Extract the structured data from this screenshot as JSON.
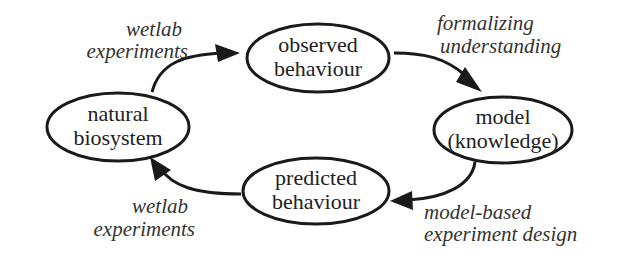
{
  "diagram": {
    "nodes": [
      {
        "id": "natural",
        "lines": [
          "natural",
          "biosystem"
        ]
      },
      {
        "id": "observed",
        "lines": [
          "observed",
          "behaviour"
        ]
      },
      {
        "id": "model",
        "lines": [
          "model",
          "(knowledge)"
        ]
      },
      {
        "id": "predicted",
        "lines": [
          "predicted",
          "behaviour"
        ]
      }
    ],
    "edges": [
      {
        "from": "natural",
        "to": "observed",
        "label": [
          "wetlab",
          "experiments"
        ]
      },
      {
        "from": "observed",
        "to": "model",
        "label": [
          "formalizing",
          "understanding"
        ]
      },
      {
        "from": "model",
        "to": "predicted",
        "label": [
          "model-based",
          "experiment design"
        ]
      },
      {
        "from": "predicted",
        "to": "natural",
        "label": [
          "wetlab",
          "experiments"
        ]
      }
    ],
    "colors": {
      "stroke": "#1a1a1a",
      "background": "#ffffff"
    }
  }
}
